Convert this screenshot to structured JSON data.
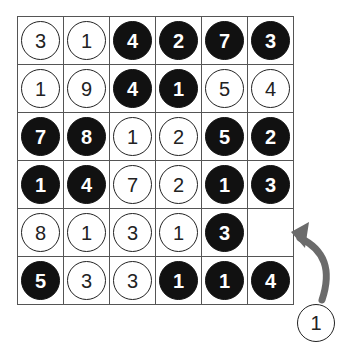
{
  "puzzle": {
    "rows": 6,
    "cols": 6,
    "cells": [
      [
        {
          "value": "3",
          "shade": "white"
        },
        {
          "value": "1",
          "shade": "white"
        },
        {
          "value": "4",
          "shade": "black"
        },
        {
          "value": "2",
          "shade": "black"
        },
        {
          "value": "7",
          "shade": "black"
        },
        {
          "value": "3",
          "shade": "black"
        }
      ],
      [
        {
          "value": "1",
          "shade": "white"
        },
        {
          "value": "9",
          "shade": "white"
        },
        {
          "value": "4",
          "shade": "black"
        },
        {
          "value": "1",
          "shade": "black"
        },
        {
          "value": "5",
          "shade": "white"
        },
        {
          "value": "4",
          "shade": "white"
        }
      ],
      [
        {
          "value": "7",
          "shade": "black"
        },
        {
          "value": "8",
          "shade": "black"
        },
        {
          "value": "1",
          "shade": "white"
        },
        {
          "value": "2",
          "shade": "white"
        },
        {
          "value": "5",
          "shade": "black"
        },
        {
          "value": "2",
          "shade": "black"
        }
      ],
      [
        {
          "value": "1",
          "shade": "black"
        },
        {
          "value": "4",
          "shade": "black"
        },
        {
          "value": "7",
          "shade": "white"
        },
        {
          "value": "2",
          "shade": "white"
        },
        {
          "value": "1",
          "shade": "black"
        },
        {
          "value": "3",
          "shade": "black"
        }
      ],
      [
        {
          "value": "8",
          "shade": "white"
        },
        {
          "value": "1",
          "shade": "white"
        },
        {
          "value": "3",
          "shade": "white"
        },
        {
          "value": "1",
          "shade": "white"
        },
        {
          "value": "3",
          "shade": "black"
        },
        {
          "value": null,
          "shade": "empty"
        }
      ],
      [
        {
          "value": "5",
          "shade": "black"
        },
        {
          "value": "3",
          "shade": "white"
        },
        {
          "value": "3",
          "shade": "white"
        },
        {
          "value": "1",
          "shade": "black"
        },
        {
          "value": "1",
          "shade": "black"
        },
        {
          "value": "4",
          "shade": "black"
        }
      ]
    ]
  },
  "loose_piece": {
    "value": "1",
    "shade": "white"
  },
  "arrow": {
    "icon": "curved-arrow-icon",
    "color": "#6b6b6b",
    "target_row": 5,
    "target_col": 6
  },
  "colors": {
    "black_disc": "#111111",
    "white_disc": "#ffffff",
    "grid_line": "#555555"
  }
}
